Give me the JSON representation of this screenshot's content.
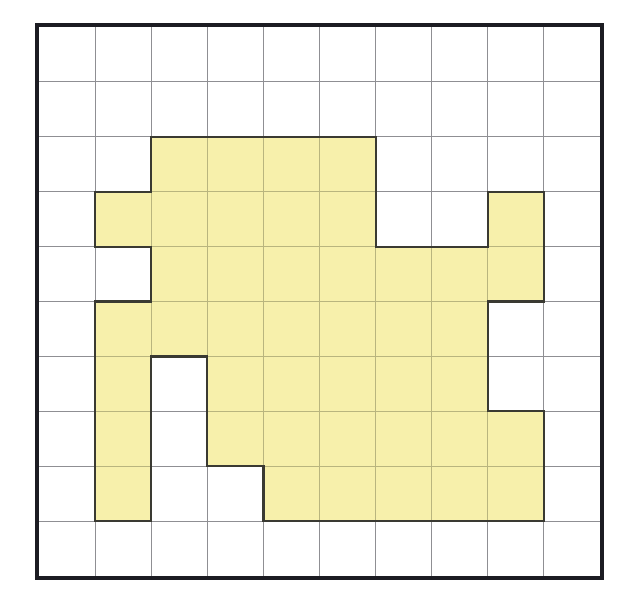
{
  "figure": {
    "kind": "grid-polyomino-area-figure",
    "title": "",
    "caption": ""
  },
  "canvas": {
    "width": 619,
    "height": 600,
    "background": "#ffffff"
  },
  "grid": {
    "origin_x": 39,
    "origin_y": 27,
    "cell_width": 56.1,
    "cell_height": 54.9,
    "columns": 10,
    "rows": 10,
    "line_color": "#8f8f93",
    "line_width": 1,
    "border_color": "#1c1c22",
    "border_width": 4,
    "show_grid": true,
    "show_border": true
  },
  "shape": {
    "name": "shaded-region",
    "fill_color": "#f7f0ab",
    "outline_color": "#3a3a32",
    "outline_width": 2.2,
    "filled_cell_count": 44,
    "filled_cells_by_row": [
      {
        "row": 0,
        "columns": []
      },
      {
        "row": 1,
        "columns": []
      },
      {
        "row": 2,
        "columns": [
          2,
          3,
          4,
          5
        ]
      },
      {
        "row": 3,
        "columns": [
          1,
          2,
          3,
          4,
          5,
          8
        ]
      },
      {
        "row": 4,
        "columns": [
          2,
          3,
          4,
          5,
          6,
          7,
          8
        ]
      },
      {
        "row": 5,
        "columns": [
          1,
          2,
          3,
          4,
          5,
          6,
          7
        ]
      },
      {
        "row": 6,
        "columns": [
          1,
          3,
          4,
          5,
          6,
          7
        ]
      },
      {
        "row": 7,
        "columns": [
          1,
          3,
          4,
          5,
          6,
          7,
          8
        ]
      },
      {
        "row": 8,
        "columns": [
          1,
          4,
          5,
          6,
          7,
          8
        ]
      },
      {
        "row": 9,
        "columns": []
      }
    ],
    "grid_mask": [
      "0000000000",
      "0000000000",
      "0011110000",
      "0111110010",
      "0011111110",
      "0111111100",
      "0101111100",
      "0101111110",
      "0100111110",
      "0000000000"
    ]
  },
  "chart_data": {
    "type": "heatmap",
    "xlabel": "",
    "ylabel": "",
    "categories": [
      "0",
      "1",
      "2",
      "3",
      "4",
      "5",
      "6",
      "7",
      "8",
      "9"
    ],
    "rows": [
      "0",
      "1",
      "2",
      "3",
      "4",
      "5",
      "6",
      "7",
      "8",
      "9"
    ],
    "values": [
      [
        0,
        0,
        0,
        0,
        0,
        0,
        0,
        0,
        0,
        0
      ],
      [
        0,
        0,
        0,
        0,
        0,
        0,
        0,
        0,
        0,
        0
      ],
      [
        0,
        0,
        1,
        1,
        1,
        1,
        0,
        0,
        0,
        0
      ],
      [
        0,
        1,
        1,
        1,
        1,
        1,
        0,
        0,
        1,
        0
      ],
      [
        0,
        0,
        1,
        1,
        1,
        1,
        1,
        1,
        1,
        0
      ],
      [
        0,
        1,
        1,
        1,
        1,
        1,
        1,
        1,
        0,
        0
      ],
      [
        0,
        1,
        0,
        1,
        1,
        1,
        1,
        1,
        0,
        0
      ],
      [
        0,
        1,
        0,
        1,
        1,
        1,
        1,
        1,
        1,
        0
      ],
      [
        0,
        1,
        0,
        0,
        1,
        1,
        1,
        1,
        1,
        0
      ],
      [
        0,
        0,
        0,
        0,
        0,
        0,
        0,
        0,
        0,
        0
      ]
    ],
    "legend": [
      {
        "label": "shaded",
        "value": 1,
        "color": "#f7f0ab"
      },
      {
        "label": "unshaded",
        "value": 0,
        "color": "#ffffff"
      }
    ],
    "legend_position": "none",
    "grid": true,
    "xlim": [
      0,
      10
    ],
    "ylim": [
      0,
      10
    ],
    "shaded_cell_count": 44,
    "total_cell_count": 100
  }
}
